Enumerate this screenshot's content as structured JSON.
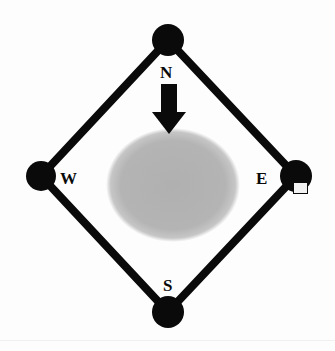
{
  "figure": {
    "background_color": "#fdfdfd",
    "stroke_color": "#0a0a0a",
    "node_fill": "#0a0a0a",
    "disc_color": "#b2b2b2",
    "arrow_color": "#0a0a0a"
  },
  "labels": {
    "north": "N",
    "east": "E",
    "south": "S",
    "west": "W"
  },
  "nodes": [
    {
      "id": "north",
      "label": "N",
      "cx": 168,
      "cy": 40,
      "r": 16
    },
    {
      "id": "east",
      "label": "E",
      "cx": 296,
      "cy": 176,
      "r": 16
    },
    {
      "id": "south",
      "label": "S",
      "cx": 168,
      "cy": 312,
      "r": 16
    },
    {
      "id": "west",
      "label": "W",
      "cx": 41,
      "cy": 176,
      "r": 15
    }
  ],
  "edges": [
    {
      "from": "north",
      "to": "east"
    },
    {
      "from": "east",
      "to": "south"
    },
    {
      "from": "south",
      "to": "west"
    },
    {
      "from": "west",
      "to": "north"
    }
  ],
  "disc": {
    "cx": 173,
    "cy": 185,
    "rx": 66,
    "ry": 56
  },
  "arrow": {
    "direction": "down",
    "shaft_x": 169,
    "shaft_top": 84,
    "shaft_bottom": 113,
    "shaft_width": 16,
    "head_half_width": 17,
    "head_tip_y": 134
  },
  "marker": {
    "id": "east-square-marker",
    "x": 294,
    "y": 183,
    "w": 14,
    "h": 11
  }
}
